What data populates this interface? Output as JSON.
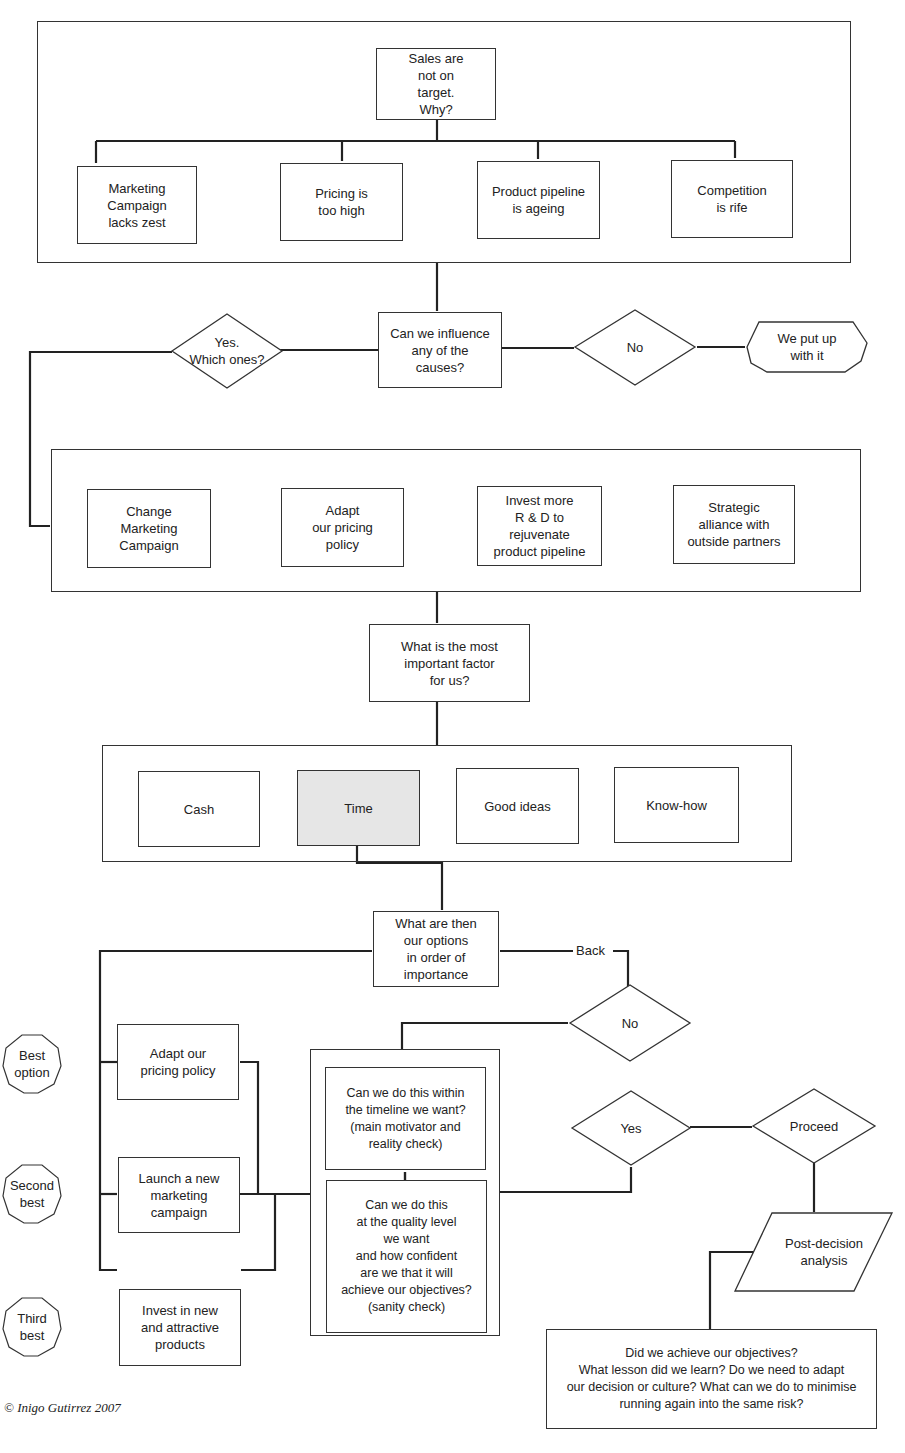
{
  "diagram": {
    "colors": {
      "line": "#333333",
      "fill": "#ffffff",
      "highlight": "#e6e6e6"
    },
    "section1": {
      "root": "Sales are\nnot on\ntarget.\nWhy?",
      "causes": [
        "Marketing\nCampaign\nlacks zest",
        "Pricing is\ntoo high",
        "Product pipeline\nis ageing",
        "Competition\nis rife"
      ]
    },
    "decision1": {
      "question": "Can we influence\nany of the\ncauses?",
      "yes": "Yes.\nWhich ones?",
      "no": "No",
      "no_result": "We put up\nwith it"
    },
    "section2": {
      "actions": [
        "Change\nMarketing\nCampaign",
        "Adapt\nour pricing\npolicy",
        "Invest more\nR & D to\nrejuvenate\nproduct pipeline",
        "Strategic\nalliance with\noutside partners"
      ]
    },
    "factor_question": "What is the most\nimportant factor\nfor us?",
    "section3": {
      "factors": [
        "Cash",
        "Time",
        "Good ideas",
        "Know-how"
      ],
      "selected": "Time"
    },
    "options_question": "What are then\nour options\nin order of\nimportance",
    "back_label": "Back",
    "ranking": [
      "Best\noption",
      "Second\nbest",
      "Third\nbest"
    ],
    "options": [
      "Adapt our\npricing policy",
      "Launch a new\nmarketing\ncampaign",
      "Invest in new\nand attractive\nproducts"
    ],
    "checks": {
      "timeline": "Can we do this within\nthe timeline we want?\n(main motivator and\nreality check)",
      "quality": "Can we do this\nat the quality level\nwe want\nand how confident\nare we that it will\nachieve our objectives?\n(sanity check)"
    },
    "check_no": "No",
    "check_yes": "Yes",
    "proceed": "Proceed",
    "post_decision": "Post-decision\nanalysis",
    "review": "Did we achieve our objectives?\nWhat lesson did we learn? Do we need to adapt\nour decision or culture? What can we do to minimise\nrunning again into the same risk?",
    "copyright": "© Inigo Gutirrez 2007"
  }
}
